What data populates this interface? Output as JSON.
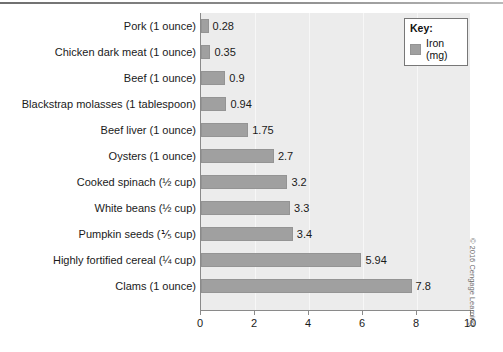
{
  "chart_data": {
    "type": "bar",
    "orientation": "horizontal",
    "title": "",
    "xlabel": "",
    "ylabel": "",
    "xlim": [
      0,
      10
    ],
    "xticks": [
      "0",
      "2",
      "4",
      "6",
      "8",
      "10"
    ],
    "grid": true,
    "legend_position": "top-right",
    "categories": [
      "Pork (1 ounce)",
      "Chicken dark meat (1 ounce)",
      "Beef (1 ounce)",
      "Blackstrap molasses (1 tablespoon)",
      "Beef liver (1 ounce)",
      "Oysters (1 ounce)",
      "Cooked spinach (½ cup)",
      "White beans (½ cup)",
      "Pumpkin seeds (⅕ cup)",
      "Highly fortified cereal (¼ cup)",
      "Clams (1 ounce)"
    ],
    "values": [
      0.28,
      0.35,
      0.9,
      0.94,
      1.75,
      2.7,
      3.2,
      3.3,
      3.4,
      5.94,
      7.8
    ],
    "value_labels": [
      "0.28",
      "0.35",
      "0.9",
      "0.94",
      "1.75",
      "2.7",
      "3.2",
      "3.3",
      "3.4",
      "5.94",
      "7.8"
    ],
    "series": [
      {
        "name": "Iron (mg)",
        "values": [
          0.28,
          0.35,
          0.9,
          0.94,
          1.75,
          2.7,
          3.2,
          3.3,
          3.4,
          5.94,
          7.8
        ]
      }
    ],
    "colors": {
      "bar": "#a0a0a0",
      "plot_background": "#ececec",
      "gridline": "#f7f7f7",
      "axis": "#8a8a8a",
      "text": "#1a1a1a"
    }
  },
  "legend": {
    "title": "Key:",
    "entry": "Iron (mg)"
  },
  "credit": {
    "text": "© 2016 Cengage Learning"
  }
}
